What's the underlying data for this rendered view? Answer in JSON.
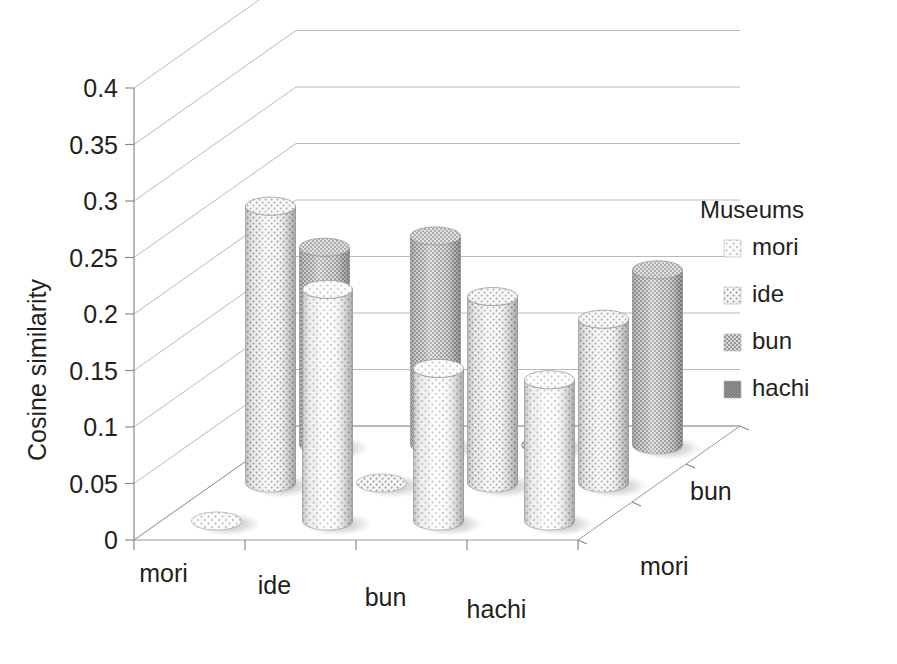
{
  "chart_data": {
    "type": "bar",
    "subtype": "3d-cylinder",
    "title": "",
    "xlabel": "",
    "ylabel": "Cosine similarity",
    "zlabel": "",
    "ylim": [
      0,
      0.4
    ],
    "ytick_step": 0.05,
    "yticks": [
      "0",
      "0.05",
      "0.1",
      "0.15",
      "0.2",
      "0.25",
      "0.3",
      "0.35",
      "0.4"
    ],
    "ytick_values": [
      0,
      0.05,
      0.1,
      0.15,
      0.2,
      0.25,
      0.3,
      0.35,
      0.4
    ],
    "categories": [
      "mori",
      "ide",
      "bun",
      "hachi"
    ],
    "depth_categories": [
      "mori",
      "ide",
      "bun"
    ],
    "depth_tick_labels": [
      "mori",
      "bun"
    ],
    "grid": true,
    "legend_position": "right",
    "legend_title": "Museums",
    "series": [
      {
        "name": "mori",
        "values": [
          0.0,
          0.205,
          0.135,
          0.125
        ]
      },
      {
        "name": "ide",
        "values": [
          0.245,
          0.0,
          0.165,
          0.145
        ]
      },
      {
        "name": "bun",
        "values": [
          0.175,
          0.185,
          0.0,
          0.155
        ]
      },
      {
        "name": "hachi",
        "values": [
          0.275,
          0.245,
          0.215,
          0.185
        ]
      }
    ],
    "patterns": {
      "mori": "sparse-dots",
      "ide": "light-dots",
      "bun": "medium-grid",
      "hachi": "dense-solid"
    },
    "colors": {
      "mori": "#f2f2f2",
      "ide": "#e8e8e8",
      "bun": "#b4b4b4",
      "hachi": "#8c8c8c",
      "gridline": "#b9b9b9",
      "axis": "#8a8a8a",
      "text": "#231f20",
      "background": "#ffffff"
    }
  },
  "legend": {
    "title": "Museums",
    "items": [
      {
        "label": "mori",
        "swatch": "sparse-dots"
      },
      {
        "label": "ide",
        "swatch": "light-dots"
      },
      {
        "label": "bun",
        "swatch": "medium-grid"
      },
      {
        "label": "hachi",
        "swatch": "dense-solid"
      }
    ]
  },
  "axes": {
    "y_title": "Cosine similarity",
    "x_categories": [
      "mori",
      "ide",
      "bun",
      "hachi"
    ],
    "z_categories": [
      "mori",
      "bun"
    ]
  }
}
